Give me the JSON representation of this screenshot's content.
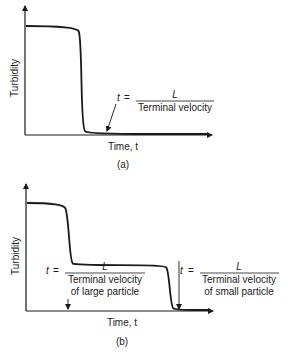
{
  "chart_data": [
    {
      "type": "line",
      "panel_label": "(a)",
      "xlabel": "Time, t",
      "ylabel": "Turbidity",
      "grid": false,
      "description": "Single-step turbidity drop (monodisperse suspension)",
      "series": [
        {
          "name": "turbidity",
          "x": [
            0,
            0.28,
            0.3,
            0.31,
            0.34,
            1.0
          ],
          "y": [
            1.0,
            1.0,
            0.9,
            0.05,
            0.0,
            0.0
          ]
        }
      ],
      "annotations": [
        {
          "id": "t_eq",
          "lhs": "t",
          "equals": "=",
          "numerator": "L",
          "denominator": "Terminal velocity"
        }
      ]
    },
    {
      "type": "line",
      "panel_label": "(b)",
      "xlabel": "Time, t",
      "ylabel": "Turbidity",
      "grid": false,
      "description": "Two-step turbidity drop (large and small particles)",
      "series": [
        {
          "name": "turbidity",
          "x": [
            0,
            0.2,
            0.22,
            0.24,
            0.26,
            0.75,
            0.77,
            0.79,
            0.81,
            1.0
          ],
          "y": [
            1.0,
            1.0,
            0.9,
            0.45,
            0.42,
            0.42,
            0.38,
            0.03,
            0.0,
            0.0
          ]
        }
      ],
      "annotations": [
        {
          "id": "t_large",
          "lhs": "t",
          "equals": "=",
          "numerator": "L",
          "denominator": "Terminal velocity",
          "denominator2": "of large particle"
        },
        {
          "id": "t_small",
          "lhs": "t",
          "equals": "=",
          "numerator": "L",
          "denominator": "Terminal velocity",
          "denominator2": "of small particle"
        }
      ]
    }
  ],
  "colors": {
    "ink": "#1a1a1a",
    "background": "#ffffff"
  }
}
